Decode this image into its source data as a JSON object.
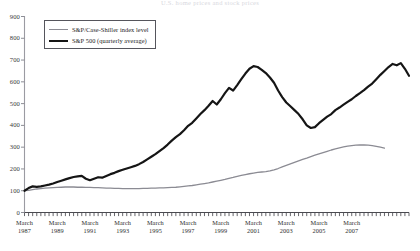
{
  "chart_data": {
    "type": "line",
    "title": "U.S. home prices and stock prices",
    "xlabel": "",
    "ylabel": "",
    "ylim": [
      0,
      900
    ],
    "ytick_step": 100,
    "yticks": [
      0,
      100,
      200,
      300,
      400,
      500,
      600,
      700,
      800,
      900
    ],
    "grid": false,
    "legend_position": "top-left",
    "x_tick_months": [
      "March",
      "March",
      "March",
      "March",
      "March",
      "March",
      "March",
      "March",
      "March",
      "March",
      "March"
    ],
    "x_tick_years": [
      "1987",
      "1989",
      "1991",
      "1993",
      "1995",
      "1997",
      "1999",
      "2001",
      "2003",
      "2005",
      "2007"
    ],
    "x_start": "1987-Q1",
    "x_end": "2008-Q2",
    "x_minor_interval": "quarterly",
    "series": [
      {
        "name": "S&P/Case-Shiller index level",
        "color": "#8b8b93",
        "width": 1.3,
        "values": [
          100,
          102,
          105,
          108,
          110,
          112,
          113,
          114,
          115,
          116,
          117,
          117,
          117,
          116,
          116,
          115,
          115,
          114,
          114,
          113,
          112,
          112,
          111,
          111,
          110,
          110,
          110,
          110,
          110,
          111,
          111,
          112,
          112,
          113,
          113,
          114,
          115,
          116,
          118,
          120,
          122,
          124,
          127,
          130,
          133,
          136,
          140,
          144,
          148,
          152,
          157,
          161,
          166,
          170,
          174,
          178,
          181,
          184,
          186,
          188,
          191,
          196,
          202,
          209,
          216,
          223,
          230,
          237,
          244,
          250,
          257,
          263,
          269,
          275,
          281,
          287,
          292,
          297,
          301,
          305,
          307,
          309,
          310,
          310,
          309,
          307,
          304,
          300,
          296
        ]
      },
      {
        "name": "S&P 500 (quarterly average)",
        "color": "#151515",
        "width": 2.2,
        "values": [
          100,
          112,
          120,
          118,
          120,
          124,
          128,
          133,
          140,
          146,
          152,
          158,
          163,
          166,
          168,
          155,
          148,
          155,
          162,
          160,
          168,
          176,
          182,
          190,
          196,
          202,
          208,
          214,
          222,
          232,
          244,
          256,
          268,
          282,
          296,
          312,
          330,
          346,
          360,
          378,
          398,
          412,
          432,
          452,
          470,
          490,
          512,
          496,
          520,
          548,
          572,
          560,
          585,
          612,
          638,
          660,
          672,
          668,
          655,
          640,
          620,
          596,
          560,
          530,
          505,
          488,
          470,
          452,
          428,
          400,
          388,
          392,
          410,
          425,
          440,
          452,
          470,
          482,
          495,
          508,
          520,
          535,
          548,
          562,
          578,
          592,
          612,
          632,
          650,
          668,
          682,
          676,
          686,
          660,
          628
        ]
      }
    ]
  },
  "legend": {
    "items": [
      {
        "label": "S&P/Case-Shiller index level",
        "style": "thin"
      },
      {
        "label": "S&P 500 (quarterly average)",
        "style": "thick"
      }
    ]
  }
}
